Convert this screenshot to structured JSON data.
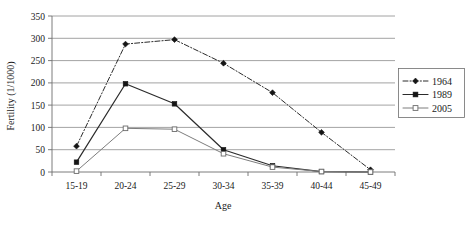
{
  "chart_data": {
    "type": "line",
    "title": "",
    "xlabel": "Age",
    "ylabel": "Fertility (1/1000)",
    "categories": [
      "15-19",
      "20-24",
      "25-29",
      "30-34",
      "35-39",
      "40-44",
      "45-49"
    ],
    "ylim": [
      0,
      350
    ],
    "yticks": [
      0,
      50,
      100,
      150,
      200,
      250,
      300,
      350
    ],
    "grid": true,
    "legend_position": "right",
    "series": [
      {
        "name": "1964",
        "marker": "filled-diamond",
        "linestyle": "dash-dot",
        "color": "#2b2b2b",
        "values": [
          58,
          287,
          297,
          244,
          178,
          89,
          5
        ]
      },
      {
        "name": "1989",
        "marker": "filled-square",
        "linestyle": "solid",
        "color": "#2b2b2b",
        "values": [
          22,
          198,
          153,
          50,
          14,
          1,
          0
        ]
      },
      {
        "name": "2005",
        "marker": "open-square",
        "linestyle": "solid",
        "color": "#7d7d7d",
        "values": [
          2,
          98,
          96,
          41,
          11,
          1,
          0
        ]
      }
    ]
  },
  "axes": {
    "y_tick_labels": [
      "0",
      "50",
      "100",
      "150",
      "200",
      "250",
      "300",
      "350"
    ],
    "x_tick_labels": [
      "15-19",
      "20-24",
      "25-29",
      "30-34",
      "35-39",
      "40-44",
      "45-49"
    ],
    "y_axis_title": "Fertility (1/1000)",
    "x_axis_title": "Age"
  },
  "legend": {
    "entries": [
      {
        "label": "1964"
      },
      {
        "label": "1989"
      },
      {
        "label": "2005"
      }
    ]
  }
}
